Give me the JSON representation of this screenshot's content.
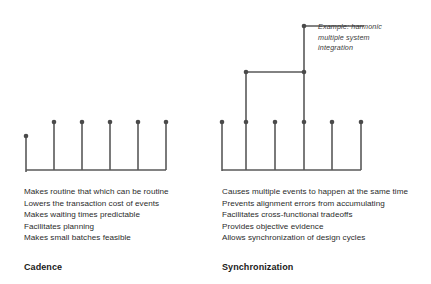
{
  "cadence": {
    "caption": "Cadence",
    "bullets": [
      "Makes routine that which can be routine",
      "Lowers the transaction cost of events",
      "Makes waiting times predictable",
      "Facilitates planning",
      "Makes small batches feasible"
    ],
    "diagram": {
      "type": "tick-timeline",
      "stroke_color": "#595959",
      "baseline_y": 170,
      "axis_x_start": 26,
      "axis_x_end": 166,
      "ticks": [
        {
          "x": 26,
          "dot_y": 136
        },
        {
          "x": 54,
          "dot_y": 122
        },
        {
          "x": 82,
          "dot_y": 122
        },
        {
          "x": 110,
          "dot_y": 122
        },
        {
          "x": 138,
          "dot_y": 122
        },
        {
          "x": 166,
          "dot_y": 122
        }
      ]
    }
  },
  "synchronization": {
    "caption": "Synchronization",
    "bullets": [
      "Causes multiple events to happen at the same time",
      "Prevents alignment errors from accumulating",
      "Facilitates cross-functional tradeoffs",
      "Provides objective evidence",
      "Allows synchronization of design cycles"
    ],
    "annotation": [
      "Example: harmonic",
      "multiple system",
      "integration"
    ],
    "diagram": {
      "type": "harmonic-tick-timeline",
      "stroke_color": "#595959",
      "baseline_y": 170,
      "axis_x_start": 7,
      "axis_x_end": 146,
      "ticks": [
        {
          "x": 7,
          "dot_y": 122
        },
        {
          "x": 31,
          "dot_y": 122
        },
        {
          "x": 60,
          "dot_y": 122
        },
        {
          "x": 89,
          "dot_y": 122
        },
        {
          "x": 117,
          "dot_y": 122
        },
        {
          "x": 146,
          "dot_y": 122
        }
      ],
      "tier_2": {
        "dot_x": 31,
        "y": 72,
        "line_x_end": 89
      },
      "tier_3": {
        "dot_x": 89,
        "y": 26,
        "line_x_end": 149
      }
    }
  }
}
